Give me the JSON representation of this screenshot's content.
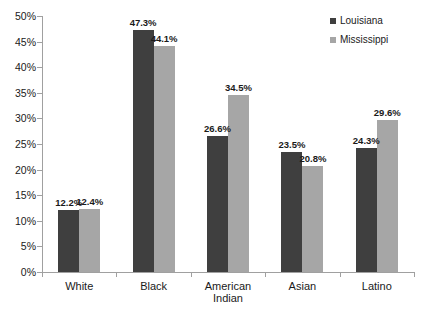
{
  "chart_data": {
    "type": "bar",
    "title": "",
    "xlabel": "",
    "ylabel": "",
    "ylim": [
      0,
      50
    ],
    "ytick_labels": [
      "0%",
      "5%",
      "10%",
      "15%",
      "20%",
      "25%",
      "30%",
      "35%",
      "40%",
      "45%",
      "50%"
    ],
    "ytick_values": [
      0,
      5,
      10,
      15,
      20,
      25,
      30,
      35,
      40,
      45,
      50
    ],
    "grid": false,
    "legend_position": "top-right",
    "categories": [
      "White",
      "Black",
      "American Indian",
      "Asian",
      "Latino"
    ],
    "category_lines": [
      [
        "White"
      ],
      [
        "Black"
      ],
      [
        "American",
        "Indian"
      ],
      [
        "Asian"
      ],
      [
        "Latino"
      ]
    ],
    "series": [
      {
        "name": "Louisiana",
        "color": "#3f3f3f",
        "values": [
          12.2,
          47.3,
          26.6,
          23.5,
          24.3
        ],
        "labels": [
          "12.2%",
          "47.3%",
          "26.6%",
          "23.5%",
          "24.3%"
        ]
      },
      {
        "name": "Mississippi",
        "color": "#a6a6a6",
        "values": [
          12.4,
          44.1,
          34.5,
          20.8,
          29.6
        ],
        "labels": [
          "12.4%",
          "44.1%",
          "34.5%",
          "20.8%",
          "29.6%"
        ]
      }
    ]
  },
  "legend": {
    "items": [
      {
        "label": "Louisiana",
        "swatch": "legend-swatch-louisiana"
      },
      {
        "label": "Mississippi",
        "swatch": "legend-swatch-mississippi"
      }
    ]
  }
}
